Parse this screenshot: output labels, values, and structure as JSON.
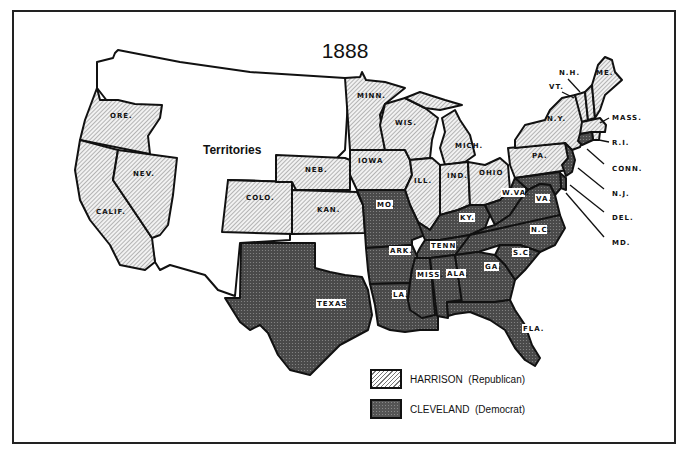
{
  "title": "1888",
  "territories_label": "Territories",
  "colors": {
    "republican_fill": "#dcdcdc",
    "democrat_fill": "#555555",
    "border": "#111111"
  },
  "legend": {
    "items": [
      {
        "candidate": "HARRISON",
        "party": "(Republican)",
        "pattern": "hatched"
      },
      {
        "candidate": "CLEVELAND",
        "party": "(Democrat)",
        "pattern": "stippled-dark"
      }
    ]
  },
  "states": {
    "ore": "ORE.",
    "calif": "CALIF.",
    "nev": "NEV.",
    "colo": "COLO.",
    "neb": "NEB.",
    "kan": "KAN.",
    "minn": "MINN.",
    "iowa": "IOWA",
    "wis": "WIS.",
    "mich": "MICH.",
    "ill": "ILL.",
    "ind": "IND.",
    "ohio": "OHIO",
    "pa": "PA.",
    "ny": "N.Y.",
    "vt": "VT.",
    "nh": "N.H.",
    "me": "ME.",
    "mass": "MASS.",
    "ri": "R.I.",
    "conn": "CONN.",
    "nj": "N.J.",
    "del": "DEL.",
    "md": "MD.",
    "mo": "MO.",
    "ky": "KY.",
    "wva": "W.VA.",
    "va": "VA.",
    "nc": "N.C.",
    "sc": "S.C.",
    "tenn": "TENN.",
    "ark": "ARK.",
    "texas": "TEXAS",
    "la": "LA.",
    "miss": "MISS.",
    "ala": "ALA.",
    "ga": "GA.",
    "fla": "FLA."
  },
  "results": {
    "harrison": [
      "ORE.",
      "CALIF.",
      "NEV.",
      "COLO.",
      "NEB.",
      "KAN.",
      "MINN.",
      "IOWA",
      "WIS.",
      "MICH.",
      "ILL.",
      "IND.",
      "OHIO",
      "PA.",
      "N.Y.",
      "VT.",
      "N.H.",
      "ME.",
      "MASS.",
      "R.I."
    ],
    "cleveland": [
      "MO.",
      "KY.",
      "W.VA.",
      "VA.",
      "N.C.",
      "S.C.",
      "TENN.",
      "ARK.",
      "TEXAS",
      "LA.",
      "MISS.",
      "ALA.",
      "GA.",
      "FLA.",
      "CONN.",
      "N.J.",
      "DEL.",
      "MD."
    ]
  }
}
